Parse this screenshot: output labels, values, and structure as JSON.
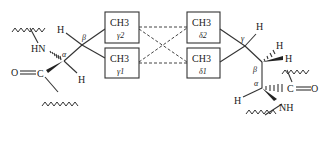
{
  "diagram": {
    "boxes": [
      {
        "id": "gamma2",
        "group": "CH3",
        "label": "γ2"
      },
      {
        "id": "gamma1",
        "group": "CH3",
        "label": "γ1"
      },
      {
        "id": "delta2",
        "group": "CH3",
        "label": "δ2"
      },
      {
        "id": "delta1",
        "group": "CH3",
        "label": "δ1"
      }
    ],
    "left_residue": {
      "atoms": {
        "hn": "HN",
        "o": "O",
        "c": "C",
        "h_alpha": "H",
        "h_beta": "H",
        "alpha": "α",
        "beta": "β"
      }
    },
    "right_residue": {
      "atoms": {
        "nh": "NH",
        "o": "O",
        "c": "C",
        "h_alpha": "H",
        "h_gamma": "H",
        "h_beta1": "H",
        "h_beta2": "H",
        "alpha": "α",
        "beta": "β",
        "gamma": "γ"
      }
    },
    "connections": [
      {
        "from": "gamma2",
        "to": "delta2",
        "style": "dashed"
      },
      {
        "from": "gamma2",
        "to": "delta1",
        "style": "dashed"
      },
      {
        "from": "gamma1",
        "to": "delta2",
        "style": "dashed"
      },
      {
        "from": "gamma1",
        "to": "delta1",
        "style": "dashed"
      }
    ],
    "colors": {
      "line": "#333333",
      "background": "#ffffff"
    }
  }
}
